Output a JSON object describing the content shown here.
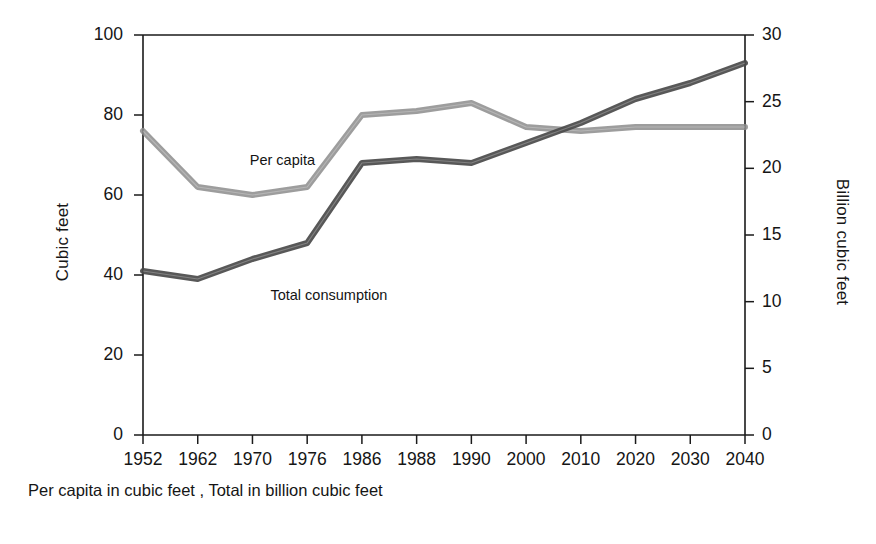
{
  "chart_data": {
    "type": "line",
    "title": "",
    "subtitle": "",
    "caption": "Per capita in cubic feet , Total in billion cubic feet",
    "categories": [
      "1952",
      "1962",
      "1970",
      "1976",
      "1986",
      "1988",
      "1990",
      "2000",
      "2010",
      "2020",
      "2030",
      "2040"
    ],
    "xlabel": "",
    "grid": false,
    "legend_position": "inline-annotation",
    "axes": {
      "left": {
        "label": "Cubic feet",
        "ticks": [
          0,
          20,
          40,
          60,
          80,
          100
        ],
        "tick_labels": [
          "0",
          "20",
          "40",
          "60",
          "80",
          "100"
        ],
        "lim": [
          0,
          100
        ]
      },
      "right": {
        "label": "Billion cubic feet",
        "ticks": [
          0,
          5,
          10,
          15,
          20,
          25,
          30
        ],
        "tick_labels": [
          "0",
          "5",
          "10",
          "15",
          "20",
          "25",
          "30"
        ],
        "lim": [
          0,
          30
        ]
      }
    },
    "series": [
      {
        "name": "Per capita",
        "axis": "left",
        "units": "cubic feet",
        "color": "#8c8c8c",
        "annotation": "Per capita",
        "values": [
          76,
          62,
          60,
          62,
          80,
          81,
          83,
          77,
          76,
          77,
          77,
          77
        ]
      },
      {
        "name": "Total consumption",
        "axis": "right",
        "units": "billion cubic feet",
        "color": "#4a4a4a",
        "annotation": "Total consumption",
        "values": [
          12.3,
          11.7,
          13.2,
          14.4,
          20.4,
          20.7,
          20.4,
          21.9,
          23.4,
          25.2,
          26.4,
          27.9
        ]
      }
    ]
  },
  "annotations": {
    "per_capita_label": "Per capita",
    "total_label": "Total consumption"
  },
  "colors": {
    "axis": "#1a1a1a",
    "per_capita_line": "#8f8f8f",
    "total_line": "#4d4d4d",
    "background": "#ffffff"
  }
}
